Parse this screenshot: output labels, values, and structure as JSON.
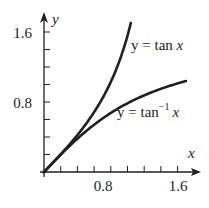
{
  "chart_data": {
    "type": "line",
    "title": "",
    "xlabel": "x",
    "ylabel": "y",
    "xlim": [
      0,
      1.85
    ],
    "ylim": [
      0,
      1.75
    ],
    "grid": false,
    "legend": "inline annotations",
    "x_ticks": [
      0.2,
      0.4,
      0.6,
      0.8,
      1.0,
      1.2,
      1.4,
      1.6
    ],
    "x_tick_labels": [
      {
        "value": 0.8,
        "label": "0.8"
      },
      {
        "value": 1.6,
        "label": "1.6"
      }
    ],
    "y_ticks": [
      0.2,
      0.4,
      0.6,
      0.8,
      1.0,
      1.2,
      1.4,
      1.6
    ],
    "y_tick_labels": [
      {
        "value": 0.8,
        "label": "0.8"
      },
      {
        "value": 1.6,
        "label": "1.6"
      }
    ],
    "series": [
      {
        "name": "y = tan x",
        "function": "tan",
        "x_range": [
          0,
          1.04
        ],
        "x": [
          0,
          0.2,
          0.4,
          0.6,
          0.8,
          0.9,
          1.0,
          1.04
        ],
        "y": [
          0,
          0.203,
          0.423,
          0.684,
          1.03,
          1.26,
          1.557,
          1.704
        ]
      },
      {
        "name": "y = tan⁻¹ x",
        "function": "arctan",
        "x_range": [
          0,
          1.7
        ],
        "x": [
          0,
          0.2,
          0.4,
          0.6,
          0.8,
          1.0,
          1.2,
          1.4,
          1.6,
          1.7
        ],
        "y": [
          0,
          0.197,
          0.381,
          0.54,
          0.675,
          0.785,
          0.876,
          0.951,
          1.012,
          1.039
        ]
      }
    ],
    "annotations": [
      {
        "text": "y = tan x",
        "series": "tan"
      },
      {
        "text": "y = tan⁻¹ x",
        "series": "arctan"
      }
    ]
  },
  "labels": {
    "x_axis": "x",
    "y_axis": "y",
    "x_tick_08": "0.8",
    "x_tick_16": "1.6",
    "y_tick_08": "0.8",
    "y_tick_16": "1.6",
    "tan_label_prefix": "y = tan ",
    "tan_label_var": "x",
    "arctan_label_prefix": "y = tan",
    "arctan_label_sup": "−1",
    "arctan_label_var": "x"
  },
  "colors": {
    "ink": "#231f20",
    "background": "#ffffff"
  }
}
